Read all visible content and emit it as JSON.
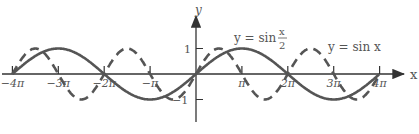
{
  "chart_data": {
    "type": "line",
    "title": "",
    "xlabel": "x",
    "ylabel": "y",
    "x_ticks": [
      "−4π",
      "−3π",
      "−2π",
      "−π",
      "π",
      "2π",
      "3π",
      "4π"
    ],
    "y_ticks": [
      "1",
      "−1"
    ],
    "xlim": [
      "−4π",
      "4π"
    ],
    "ylim": [
      -1,
      1
    ],
    "series": [
      {
        "name": "y = sin x/2",
        "style": "solid",
        "function": "sin(x/2)"
      },
      {
        "name": "y = sin x",
        "style": "dashed",
        "function": "sin(x)"
      }
    ],
    "annotations": [
      {
        "text": "y = sin",
        "frac_num": "x",
        "frac_den": "2"
      },
      {
        "text": "y = sin x"
      }
    ],
    "colors": {
      "curve": "#555555",
      "axis": "#333333"
    }
  }
}
